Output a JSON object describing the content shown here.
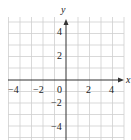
{
  "diagram": {
    "type": "coordinate-grid",
    "x_axis_label": "x",
    "y_axis_label": "y",
    "x_range": [
      -5,
      5
    ],
    "y_range": [
      -5,
      5
    ],
    "grid_step": 1,
    "x_tick_labels": [
      "−4",
      "−2",
      "0",
      "2",
      "4"
    ],
    "y_tick_labels": [
      "4",
      "2",
      "−2",
      "−4"
    ],
    "colors": {
      "grid": "#c8c8c8",
      "axis": "#333333"
    }
  }
}
